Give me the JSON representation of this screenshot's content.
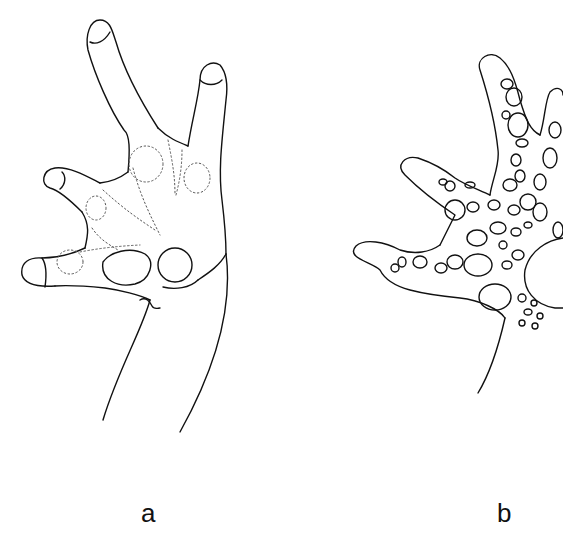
{
  "figure": {
    "panels": [
      {
        "id": "a",
        "label": "a",
        "description": "Outline drawing of a frog hand (manus) in palmar view with four fingers, subarticular tubercles and palmar tubercles"
      },
      {
        "id": "b",
        "label": "b",
        "description": "Outline drawing of a frog hand in palmar view covered with numerous supernumerary tubercles"
      }
    ],
    "colors": {
      "ink": "#111111",
      "background": "#ffffff"
    }
  }
}
